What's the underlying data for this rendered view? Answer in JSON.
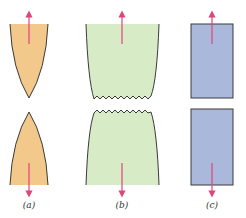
{
  "figure": {
    "panels": [
      {
        "id": "a",
        "label": "(a)",
        "type": "ductile-cup-cone-point",
        "fill": "#f2c98a"
      },
      {
        "id": "b",
        "label": "(b)",
        "type": "moderately-ductile-jagged",
        "fill": "#d7ebc6"
      },
      {
        "id": "c",
        "label": "(c)",
        "type": "brittle-flat",
        "fill": "#aab8dc"
      }
    ],
    "colors": {
      "outline": "#3a3a3a",
      "arrow": "#e0457a"
    }
  }
}
